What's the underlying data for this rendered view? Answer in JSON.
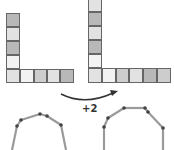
{
  "label": "+2",
  "colors": {
    "dark": "#b8b8b8",
    "mid": "#cdcdcd",
    "light": "#e2e2e2",
    "pale": "#f2f2f2",
    "border": "#666666",
    "rod": "#9a9a9a",
    "joint": "#444444",
    "arrow": "#333333"
  },
  "left_L": {
    "vertical": [
      {
        "x": 6,
        "y": 13,
        "w": 14,
        "h": 14,
        "shade": "dark"
      },
      {
        "x": 6,
        "y": 27,
        "w": 14,
        "h": 14,
        "shade": "light"
      },
      {
        "x": 6,
        "y": 41,
        "w": 14,
        "h": 14,
        "shade": "dark"
      },
      {
        "x": 6,
        "y": 55,
        "w": 14,
        "h": 14,
        "shade": "pale"
      }
    ],
    "horizontal": [
      {
        "x": 6,
        "y": 69,
        "w": 14,
        "h": 14,
        "shade": "light"
      },
      {
        "x": 20,
        "y": 69,
        "w": 14,
        "h": 14,
        "shade": "pale"
      },
      {
        "x": 34,
        "y": 69,
        "w": 13,
        "h": 14,
        "shade": "mid"
      },
      {
        "x": 47,
        "y": 69,
        "w": 13,
        "h": 14,
        "shade": "light"
      },
      {
        "x": 60,
        "y": 69,
        "w": 14,
        "h": 14,
        "shade": "dark"
      }
    ]
  },
  "right_L": {
    "vertical": [
      {
        "x": 88,
        "y": -2,
        "w": 14,
        "h": 14,
        "shade": "light"
      },
      {
        "x": 88,
        "y": 12,
        "w": 14,
        "h": 14,
        "shade": "dark"
      },
      {
        "x": 88,
        "y": 26,
        "w": 14,
        "h": 14,
        "shade": "light"
      },
      {
        "x": 88,
        "y": 40,
        "w": 14,
        "h": 14,
        "shade": "dark"
      },
      {
        "x": 88,
        "y": 54,
        "w": 14,
        "h": 14,
        "shade": "pale"
      }
    ],
    "horizontal": [
      {
        "x": 88,
        "y": 68,
        "w": 14,
        "h": 15,
        "shade": "light"
      },
      {
        "x": 102,
        "y": 68,
        "w": 14,
        "h": 15,
        "shade": "pale"
      },
      {
        "x": 116,
        "y": 68,
        "w": 13,
        "h": 15,
        "shade": "mid"
      },
      {
        "x": 129,
        "y": 68,
        "w": 14,
        "h": 15,
        "shade": "light"
      },
      {
        "x": 143,
        "y": 68,
        "w": 14,
        "h": 15,
        "shade": "dark"
      },
      {
        "x": 157,
        "y": 68,
        "w": 14,
        "h": 15,
        "shade": "mid"
      }
    ]
  },
  "left_chain": [
    [
      12,
      150
    ],
    [
      17,
      126
    ],
    [
      21,
      120
    ],
    [
      40,
      114
    ],
    [
      47,
      116
    ],
    [
      61,
      125
    ],
    [
      66,
      150
    ]
  ],
  "right_chain": [
    [
      104,
      150
    ],
    [
      104,
      127
    ],
    [
      108,
      118
    ],
    [
      124,
      108
    ],
    [
      145,
      108
    ],
    [
      148,
      112
    ],
    [
      163,
      128
    ],
    [
      163,
      150
    ]
  ]
}
